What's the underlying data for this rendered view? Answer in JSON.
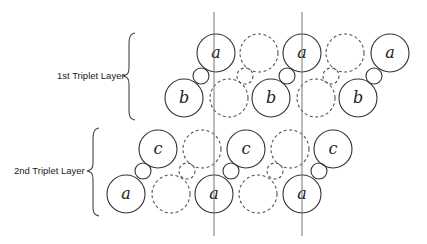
{
  "diagram": {
    "layers": [
      {
        "label": "1st Triplet Layer",
        "upper_letter": "a",
        "lower_letter": "b",
        "solid_triplets": 3,
        "dashed_triplets": 2
      },
      {
        "label": "2nd Triplet Layer",
        "upper_letter": "c",
        "lower_letter": "a",
        "solid_triplets": 3,
        "dashed_triplets": 2
      }
    ],
    "vertical_guides": 2
  }
}
